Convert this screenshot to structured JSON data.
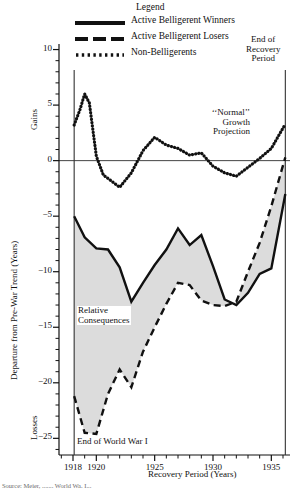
{
  "figure": {
    "legend_title": "Legend",
    "y_axis_label": "Departure from Pre-War Trend (Years)",
    "x_axis_label": "Recovery Period (Years)",
    "gains_label": "Gains",
    "losses_label": "Losses",
    "annotations": {
      "end_of_recovery": "End of\nRecovery\nPeriod",
      "end_of_recovery_l1": "End of",
      "end_of_recovery_l2": "Recovery",
      "end_of_recovery_l3": "Period",
      "normal_growth_l1": "‘‘Normal’’",
      "normal_growth_l2": "Growth",
      "normal_growth_l3": "Projection",
      "relative_consequences_l1": "Relative",
      "relative_consequences_l2": "Consequences",
      "end_of_wwi": "End of World War I"
    },
    "caption": "Source: Meier, ....... World Wa. I..."
  },
  "chart_data": {
    "type": "line",
    "title": "",
    "xlabel": "Recovery Period (Years)",
    "ylabel": "Departure from Pre-War Trend (Years)",
    "xlim": [
      1916.8,
      1936.6
    ],
    "ylim": [
      -26.5,
      10.5
    ],
    "xticks": [
      1918,
      1920,
      1925,
      1930,
      1935
    ],
    "xtick_labels": [
      "1918",
      "1920",
      "1925",
      "1930",
      "1935"
    ],
    "x_minor_tick_step": 1,
    "yticks": [
      10,
      5,
      0,
      -5,
      -10,
      -15,
      -20,
      -25
    ],
    "ytick_labels": [
      "10",
      "5",
      "0",
      "−5",
      "−10",
      "−15",
      "−20",
      "−25"
    ],
    "y_minor_tick_step": 1,
    "grid": false,
    "zero_line": 0,
    "legend_position": "top",
    "shaded_region": {
      "label_l1": "Relative",
      "label_l2": "Consequences",
      "between": [
        "Active Belligerent Winners",
        "Active Belligerent Losers"
      ],
      "fill": "#d6d6d6"
    },
    "vertical_markers": [
      {
        "x": 1918.1,
        "label": "End of World War I"
      },
      {
        "x": 1936.2,
        "label": "End of Recovery Period"
      }
    ],
    "series": [
      {
        "name": "Active Belligerent Winners",
        "style": "solid",
        "color": "#111111",
        "x": [
          1918.1,
          1919,
          1920,
          1921,
          1922,
          1923,
          1924,
          1925,
          1926,
          1927,
          1928,
          1929,
          1930,
          1931,
          1932,
          1933,
          1934,
          1935,
          1936.2
        ],
        "values": [
          -5.0,
          -6.9,
          -7.9,
          -8.0,
          -9.6,
          -12.7,
          -11.0,
          -9.4,
          -8.0,
          -6.1,
          -7.6,
          -6.7,
          -9.5,
          -12.5,
          -13.0,
          -11.9,
          -10.2,
          -9.7,
          -3.0
        ]
      },
      {
        "name": "Active Belligerent Losers",
        "style": "dashed",
        "color": "#111111",
        "x": [
          1918.1,
          1919,
          1920,
          1921,
          1922,
          1923,
          1924,
          1925,
          1926,
          1927,
          1928,
          1929,
          1930,
          1931,
          1932,
          1933,
          1934,
          1935,
          1936.2
        ],
        "values": [
          -21.2,
          -24.5,
          -24.6,
          -21.0,
          -18.8,
          -20.4,
          -17.2,
          -15.0,
          -12.9,
          -11.0,
          -11.2,
          -12.6,
          -13.0,
          -13.1,
          -12.7,
          -10.0,
          -7.4,
          -4.1,
          0.3
        ]
      },
      {
        "name": "Non-Belligerents",
        "style": "dotted",
        "color": "#111111",
        "x": [
          1918.1,
          1918.6,
          1919,
          1919.4,
          1920,
          1920.6,
          1921,
          1922,
          1923,
          1924,
          1925,
          1926,
          1927,
          1928,
          1929,
          1930,
          1931,
          1932,
          1933,
          1934,
          1935,
          1936.2
        ],
        "values": [
          3.2,
          4.6,
          6.0,
          5.2,
          0.4,
          -1.3,
          -1.6,
          -2.4,
          -1.1,
          0.9,
          2.1,
          1.4,
          1.1,
          0.5,
          0.7,
          -0.5,
          -1.1,
          -1.4,
          -0.6,
          0.2,
          1.1,
          3.3
        ]
      }
    ]
  }
}
